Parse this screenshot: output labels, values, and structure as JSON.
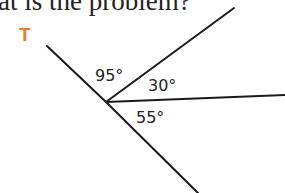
{
  "header": {
    "text": "at is the problem?"
  },
  "figure": {
    "label": "T",
    "label_color": "#f07a2a",
    "angles": [
      {
        "value": "95°"
      },
      {
        "value": "30°"
      },
      {
        "value": "55°"
      }
    ]
  }
}
